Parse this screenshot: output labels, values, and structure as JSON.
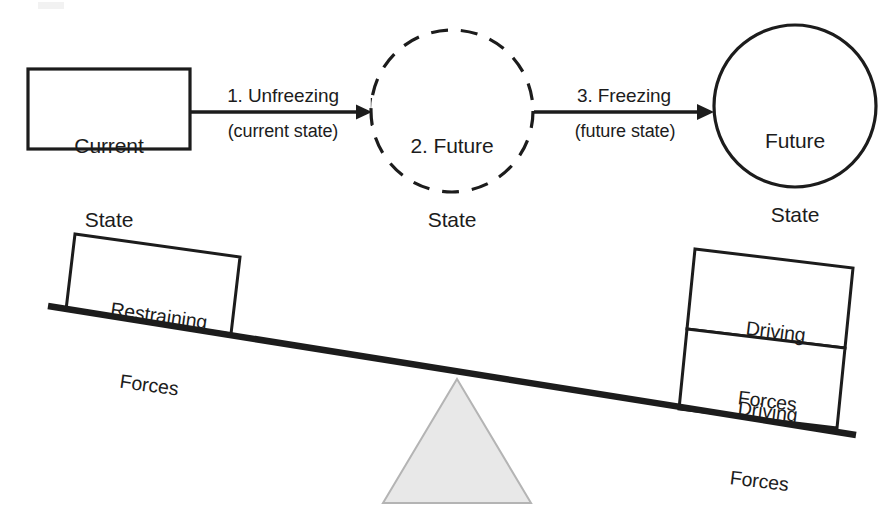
{
  "diagram": {
    "colors": {
      "stroke": "#1c1c1c",
      "text": "#1c1c1c",
      "fulcrum_fill": "#e8e8e8",
      "fulcrum_stroke": "#b0b0b0",
      "background": "#ffffff"
    },
    "process": {
      "nodes": [
        {
          "id": "current-state",
          "shape": "rectangle",
          "line1": "Current",
          "line2": "State"
        },
        {
          "id": "future-state-dashed",
          "shape": "dashed-circle",
          "line1": "2. Future",
          "line2": "State"
        },
        {
          "id": "future-state-solid",
          "shape": "circle",
          "line1": "Future",
          "line2": "State"
        }
      ],
      "arrows": [
        {
          "id": "arrow-unfreezing",
          "top_label": "1. Unfreezing",
          "bottom_label": "(current state)",
          "endpoint_style": "bar-tick"
        },
        {
          "id": "arrow-freezing",
          "top_label": "3. Freezing",
          "bottom_label": "(future state)",
          "endpoint_style": "arrowhead"
        }
      ]
    },
    "force_field": {
      "beam": {
        "id": "seesaw-beam",
        "tilt": "down-to-the-right"
      },
      "fulcrum": {
        "id": "fulcrum-triangle",
        "shape": "triangle"
      },
      "blocks": [
        {
          "id": "restraining-forces-block",
          "side": "left",
          "line1": "Restraining",
          "line2": "Forces"
        },
        {
          "id": "driving-forces-block-upper",
          "side": "right",
          "line1": "Driving",
          "line2": "Forces"
        },
        {
          "id": "driving-forces-block-lower",
          "side": "right",
          "line1": "Driving",
          "line2": "Forces"
        }
      ]
    }
  }
}
